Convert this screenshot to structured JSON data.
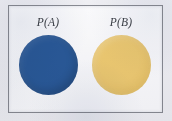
{
  "figure": {
    "kind": "probability-venn-diagram",
    "background_color": "#f4f4f6",
    "plate": {
      "border_color": "#8b8d94",
      "fill_color": "#ffffff"
    },
    "labels": {
      "event_a": "P(A)",
      "event_b": "P(B)"
    },
    "shapes": [
      {
        "name": "event-a-circle",
        "label": "P(A)",
        "color": "#2b5c9b",
        "color_name": "blue",
        "diameter_px": 59
      },
      {
        "name": "event-b-circle",
        "label": "P(B)",
        "color": "#f3ce73",
        "color_name": "yellow",
        "diameter_px": 59
      }
    ],
    "overlap": "none"
  }
}
